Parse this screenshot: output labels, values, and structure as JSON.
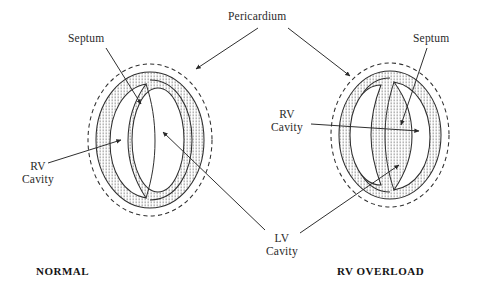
{
  "figure": {
    "title_left": "NORMAL",
    "title_right": "RV OVERLOAD",
    "labels": {
      "pericardium": "Pericardium",
      "septum_left": "Septum",
      "septum_right": "Septum",
      "rv_cavity_left": "RV\nCavity",
      "rv_cavity_right": "RV\nCavity",
      "lv_cavity": "LV\nCavity"
    },
    "colors": {
      "ink": "#2a2a2a",
      "stipple": "#6e6e6e",
      "background": "#ffffff",
      "cavity_fill": "#ffffff"
    },
    "panels": [
      {
        "name": "normal",
        "caption": "NORMAL",
        "structures": [
          "pericardium",
          "myocardium",
          "rv-cavity",
          "septum",
          "lv-cavity"
        ],
        "rv_cavity_side": "left",
        "lv_shape": "oval"
      },
      {
        "name": "rv-overload",
        "caption": "RV OVERLOAD",
        "structures": [
          "pericardium",
          "myocardium",
          "rv-cavity",
          "septum",
          "lv-cavity"
        ],
        "rv_cavity_side": "right",
        "lv_shape": "d-shaped"
      }
    ],
    "annotations": [
      {
        "label": "Pericardium",
        "targets": [
          "normal.pericardium",
          "rv-overload.pericardium"
        ]
      },
      {
        "label": "Septum",
        "targets": [
          "normal.septum"
        ]
      },
      {
        "label": "Septum",
        "targets": [
          "rv-overload.septum"
        ]
      },
      {
        "label": "RV Cavity",
        "targets": [
          "normal.rv-cavity"
        ]
      },
      {
        "label": "RV Cavity",
        "targets": [
          "rv-overload.rv-cavity"
        ]
      },
      {
        "label": "LV Cavity",
        "targets": [
          "normal.lv-cavity",
          "rv-overload.lv-cavity"
        ]
      }
    ]
  }
}
